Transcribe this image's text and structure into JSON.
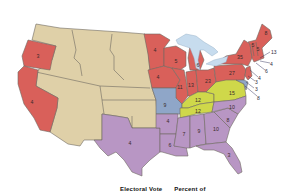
{
  "map": {
    "subject": "Presidential election electoral vote map (United States, 1860)",
    "colors": {
      "red_states": "#d9605a",
      "territories": "#dfd0a8",
      "purple_states": "#b896c4",
      "yellow_states": "#cfd84a",
      "blue_states": "#8fa6c8",
      "water": "#c7dcee",
      "border": "#6f6a62",
      "background": "#ffffff"
    },
    "labels": {
      "oregon": "3",
      "california": "4",
      "minnesota": "4",
      "iowa": "4",
      "wisconsin": "5",
      "michigan": "6",
      "illinois": "11",
      "indiana": "13",
      "ohio": "23",
      "pennsylvania": "27",
      "new_york": "35",
      "maine": "8",
      "vermont": "5",
      "new_hampshire": "5",
      "massachusetts": "13",
      "rhode_island": "4",
      "connecticut": "6",
      "new_jersey": "4",
      "delaware": "3",
      "maryland": "8",
      "missouri": "9",
      "kentucky": "12",
      "tennessee": "12",
      "virginia": "15",
      "north_carolina": "10",
      "south_carolina": "8",
      "georgia": "10",
      "alabama": "9",
      "mississippi": "7",
      "louisiana": "6",
      "arkansas": "4",
      "texas": "4",
      "florida": "3",
      "nj_split": "3"
    }
  },
  "caption": {
    "part1": "Electoral Vote",
    "part2": "Percent of"
  }
}
